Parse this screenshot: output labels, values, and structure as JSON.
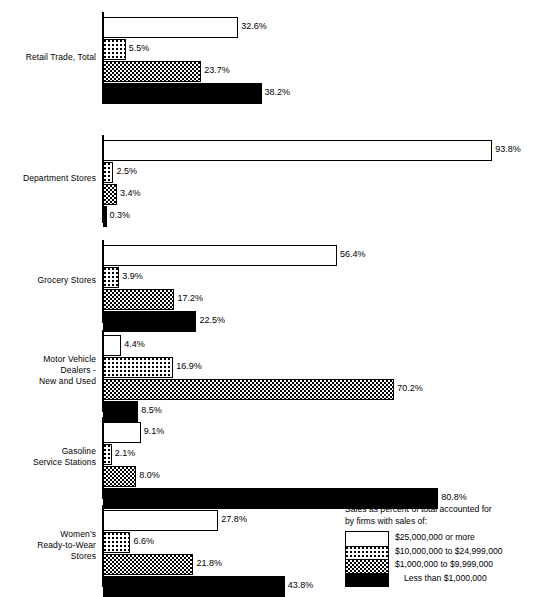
{
  "chart_data": {
    "type": "bar",
    "orientation": "horizontal",
    "title": "",
    "xlabel": "",
    "ylabel": "",
    "grid": false,
    "xlim": [
      0,
      100
    ],
    "value_suffix": "%",
    "legend": {
      "position": "bottom-right",
      "title_line1": "Sales as percent of total accounted for",
      "title_line2": "by firms with sales of:",
      "entries": [
        {
          "key": "25m_or_more",
          "label": "$25,000,000 or more",
          "pattern": "white"
        },
        {
          "key": "10m_to_24m",
          "label": "$10,000,000 to $24,999,000",
          "pattern": "dots"
        },
        {
          "key": "1m_to_9m",
          "label": "$1,000,000 to $9,999,000",
          "pattern": "check"
        },
        {
          "key": "less_than_1m",
          "label": "Less than $1,000,000",
          "pattern": "black"
        }
      ]
    },
    "series": [
      {
        "name": "$25,000,000 or more",
        "pattern": "white",
        "values": [
          32.6,
          93.8,
          56.4,
          4.4,
          9.1,
          27.8
        ]
      },
      {
        "name": "$10,000,000 to $24,999,000",
        "pattern": "dots",
        "values": [
          5.5,
          2.5,
          3.9,
          16.9,
          2.1,
          6.6
        ]
      },
      {
        "name": "$1,000,000 to $9,999,000",
        "pattern": "check",
        "values": [
          23.7,
          3.4,
          17.2,
          70.2,
          8.0,
          21.8
        ]
      },
      {
        "name": "Less than $1,000,000",
        "pattern": "black",
        "values": [
          38.2,
          0.3,
          22.5,
          8.5,
          80.8,
          43.8
        ]
      }
    ],
    "categories": [
      "Retail Trade, Total",
      "Department Stores",
      "Grocery Stores",
      "Motor Vehicle\nDealers -\nNew and Used",
      "Gasoline\nService Stations",
      "Women's\nReady-to-Wear\nStores"
    ],
    "groups": [
      {
        "category": "Retail Trade, Total",
        "bars": [
          {
            "pattern": "white",
            "value": 32.6,
            "label": "32.6%"
          },
          {
            "pattern": "dots",
            "value": 5.5,
            "label": "5.5%"
          },
          {
            "pattern": "check",
            "value": 23.7,
            "label": "23.7%"
          },
          {
            "pattern": "black",
            "value": 38.2,
            "label": "38.2%"
          }
        ]
      },
      {
        "category": "Department Stores",
        "bars": [
          {
            "pattern": "white",
            "value": 93.8,
            "label": "93.8%"
          },
          {
            "pattern": "dots",
            "value": 2.5,
            "label": "2.5%"
          },
          {
            "pattern": "check",
            "value": 3.4,
            "label": "3.4%"
          },
          {
            "pattern": "black",
            "value": 0.3,
            "label": "0.3%"
          }
        ]
      },
      {
        "category": "Grocery Stores",
        "bars": [
          {
            "pattern": "white",
            "value": 56.4,
            "label": "56.4%"
          },
          {
            "pattern": "dots",
            "value": 3.9,
            "label": "3.9%"
          },
          {
            "pattern": "check",
            "value": 17.2,
            "label": "17.2%"
          },
          {
            "pattern": "black",
            "value": 22.5,
            "label": "22.5%"
          }
        ]
      },
      {
        "category": "Motor Vehicle\nDealers -\nNew and Used",
        "bars": [
          {
            "pattern": "white",
            "value": 4.4,
            "label": "4.4%"
          },
          {
            "pattern": "dots",
            "value": 16.9,
            "label": "16.9%"
          },
          {
            "pattern": "check",
            "value": 70.2,
            "label": "70.2%"
          },
          {
            "pattern": "black",
            "value": 8.5,
            "label": "8.5%"
          }
        ]
      },
      {
        "category": "Gasoline\nService Stations",
        "bars": [
          {
            "pattern": "white",
            "value": 9.1,
            "label": "9.1%"
          },
          {
            "pattern": "dots",
            "value": 2.1,
            "label": "2.1%"
          },
          {
            "pattern": "check",
            "value": 8.0,
            "label": "8.0%"
          },
          {
            "pattern": "black",
            "value": 80.8,
            "label": "80.8%"
          }
        ]
      },
      {
        "category": "Women's\nReady-to-Wear\nStores",
        "bars": [
          {
            "pattern": "white",
            "value": 27.8,
            "label": "27.8%"
          },
          {
            "pattern": "dots",
            "value": 6.6,
            "label": "6.6%"
          },
          {
            "pattern": "check",
            "value": 21.8,
            "label": "21.8%"
          },
          {
            "pattern": "black",
            "value": 43.8,
            "label": "43.8%"
          }
        ]
      }
    ]
  },
  "layout": {
    "axis_x": 102,
    "bar_x": 103,
    "px_per_percent": 4.15,
    "group_tops": [
      12,
      135,
      240,
      330,
      417,
      505
    ],
    "group_heights": [
      92,
      88,
      83,
      82,
      82,
      82
    ]
  }
}
